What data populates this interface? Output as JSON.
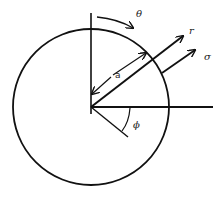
{
  "diagram": {
    "labels": {
      "theta": "θ",
      "r": "r",
      "sigma": "σ",
      "a": "a",
      "phi": "ϕ"
    },
    "colors": {
      "stroke": "#111111",
      "background": "#ffffff"
    },
    "circle": {
      "cx": 91,
      "cy": 107,
      "r": 78
    }
  }
}
